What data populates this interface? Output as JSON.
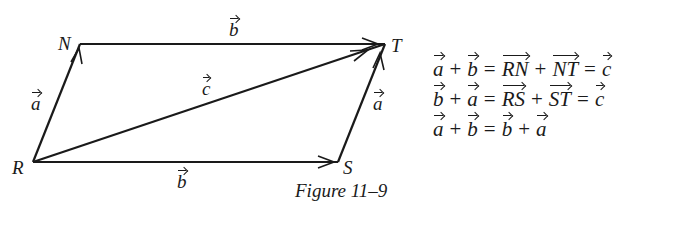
{
  "figure": {
    "caption": "Figure 11–9",
    "points": {
      "R": {
        "label": "R",
        "x": 33,
        "y": 162
      },
      "N": {
        "label": "N",
        "x": 80,
        "y": 44
      },
      "T": {
        "label": "T",
        "x": 385,
        "y": 44
      },
      "S": {
        "label": "S",
        "x": 338,
        "y": 162
      }
    },
    "vectors": [
      {
        "from": "R",
        "to": "N",
        "label": "a"
      },
      {
        "from": "N",
        "to": "T",
        "label": "b"
      },
      {
        "from": "R",
        "to": "S",
        "label": "b"
      },
      {
        "from": "S",
        "to": "T",
        "label": "a"
      },
      {
        "from": "R",
        "to": "T",
        "label": "c"
      }
    ],
    "vector_labels": {
      "a_left": "a",
      "b_top": "b",
      "c_diag": "c",
      "a_right": "a",
      "b_bottom": "b"
    }
  },
  "equations": [
    {
      "terms": [
        "a",
        "+",
        "b",
        "=",
        "RN",
        "+",
        "NT",
        "=",
        "c"
      ]
    },
    {
      "terms": [
        "b",
        "+",
        "a",
        "=",
        "RS",
        "+",
        "ST",
        "=",
        "c"
      ]
    },
    {
      "terms": [
        "a",
        "+",
        "b",
        "=",
        "b",
        "+",
        "a"
      ]
    }
  ],
  "eq_text": {
    "e0": {
      "t0": "a",
      "t1": "+",
      "t2": "b",
      "t3": "=",
      "t4": "RN",
      "t5": "+",
      "t6": "NT",
      "t7": "=",
      "t8": "c"
    },
    "e1": {
      "t0": "b",
      "t1": "+",
      "t2": "a",
      "t3": "=",
      "t4": "RS",
      "t5": "+",
      "t6": "ST",
      "t7": "=",
      "t8": "c"
    },
    "e2": {
      "t0": "a",
      "t1": "+",
      "t2": "b",
      "t3": "=",
      "t4": "b",
      "t5": "+",
      "t6": "a"
    }
  }
}
